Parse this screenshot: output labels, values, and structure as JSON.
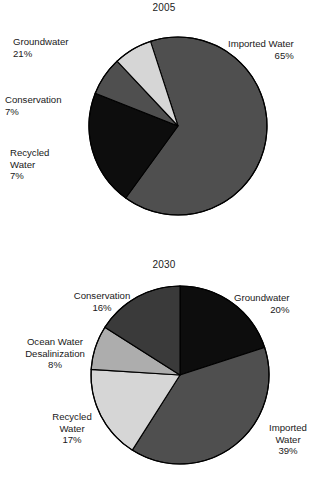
{
  "document": {
    "type": "two-pie-chart-figure",
    "background_color": "#ffffff",
    "text_color": "#191919"
  },
  "palette": {
    "black": "#0d0d0d",
    "dark_gray": "#3a3a3a",
    "medium_gray": "#4f4f4f",
    "mid_light_gray": "#adadad",
    "light_gray": "#d6d6d6",
    "outline": "#000000"
  },
  "charts": [
    {
      "id": "chart-2005",
      "title": "2005",
      "center": {
        "x": 178,
        "y": 126
      },
      "radius": 89,
      "start_angle_deg": -18,
      "labels": [
        {
          "name": "imported-water",
          "label": "Imported Water",
          "pct": "65%",
          "align": "left",
          "x": 228,
          "y": 38
        },
        {
          "name": "groundwater",
          "label": "Groundwater",
          "pct": "21%",
          "align": "right",
          "x": 13,
          "y": 36,
          "width": 125
        },
        {
          "name": "conservation",
          "label": "Conservation",
          "pct": "7%",
          "align": "right",
          "x": 5,
          "y": 94,
          "width": 83
        },
        {
          "name": "recycled-water",
          "label": "Recycled\nWater",
          "pct": "7%",
          "align": "right",
          "x": 10,
          "y": 147,
          "width": 72
        }
      ]
    },
    {
      "id": "chart-2030",
      "title": "2030",
      "center": {
        "x": 180,
        "y": 130
      },
      "radius": 89,
      "start_angle_deg": 0,
      "labels": [
        {
          "name": "groundwater",
          "label": "Groundwater",
          "pct": "20%",
          "align": "left",
          "x": 234,
          "y": 47
        },
        {
          "name": "conservation",
          "label": "Conservation",
          "pct": "16%",
          "align": "center",
          "x": 50,
          "y": 45,
          "width": 104
        },
        {
          "name": "ocean-water-desalinization",
          "label": "Ocean Water\nDesalinization",
          "pct": "8%",
          "align": "center",
          "x": 2,
          "y": 91,
          "width": 106
        },
        {
          "name": "recycled-water",
          "label": "Recycled\nWater",
          "pct": "17%",
          "align": "center",
          "x": 32,
          "y": 166,
          "width": 80
        },
        {
          "name": "imported-water",
          "label": "Imported\nWater",
          "pct": "39%",
          "align": "center",
          "x": 252,
          "y": 177,
          "width": 72
        }
      ]
    }
  ],
  "chart_data": [
    {
      "type": "pie",
      "title": "2005",
      "xlabel": "",
      "ylabel": "",
      "grid": false,
      "legend": "data-labels-outside",
      "total_pct": 100,
      "categories": [
        "Imported Water",
        "Groundwater",
        "Conservation",
        "Recycled Water"
      ],
      "values": [
        65,
        21,
        7,
        7
      ],
      "slices": [
        {
          "label": "Imported Water",
          "value": 65,
          "value_label": "65%",
          "color": "#4f4f4f"
        },
        {
          "label": "Groundwater",
          "value": 21,
          "value_label": "21%",
          "color": "#0d0d0d"
        },
        {
          "label": "Conservation",
          "value": 7,
          "value_label": "7%",
          "color": "#4f4f4f"
        },
        {
          "label": "Recycled Water",
          "value": 7,
          "value_label": "7%",
          "color": "#d6d6d6"
        }
      ]
    },
    {
      "type": "pie",
      "title": "2030",
      "xlabel": "",
      "ylabel": "",
      "grid": false,
      "legend": "data-labels-outside",
      "total_pct": 100,
      "categories": [
        "Groundwater",
        "Imported Water",
        "Recycled Water",
        "Ocean Water Desalinization",
        "Conservation"
      ],
      "values": [
        20,
        39,
        17,
        8,
        16
      ],
      "slices": [
        {
          "label": "Groundwater",
          "value": 20,
          "value_label": "20%",
          "color": "#0d0d0d"
        },
        {
          "label": "Imported Water",
          "value": 39,
          "value_label": "39%",
          "color": "#4f4f4f"
        },
        {
          "label": "Recycled Water",
          "value": 17,
          "value_label": "17%",
          "color": "#d6d6d6"
        },
        {
          "label": "Ocean Water Desalinization",
          "value": 8,
          "value_label": "8%",
          "color": "#adadad"
        },
        {
          "label": "Conservation",
          "value": 16,
          "value_label": "16%",
          "color": "#3a3a3a"
        }
      ]
    }
  ]
}
